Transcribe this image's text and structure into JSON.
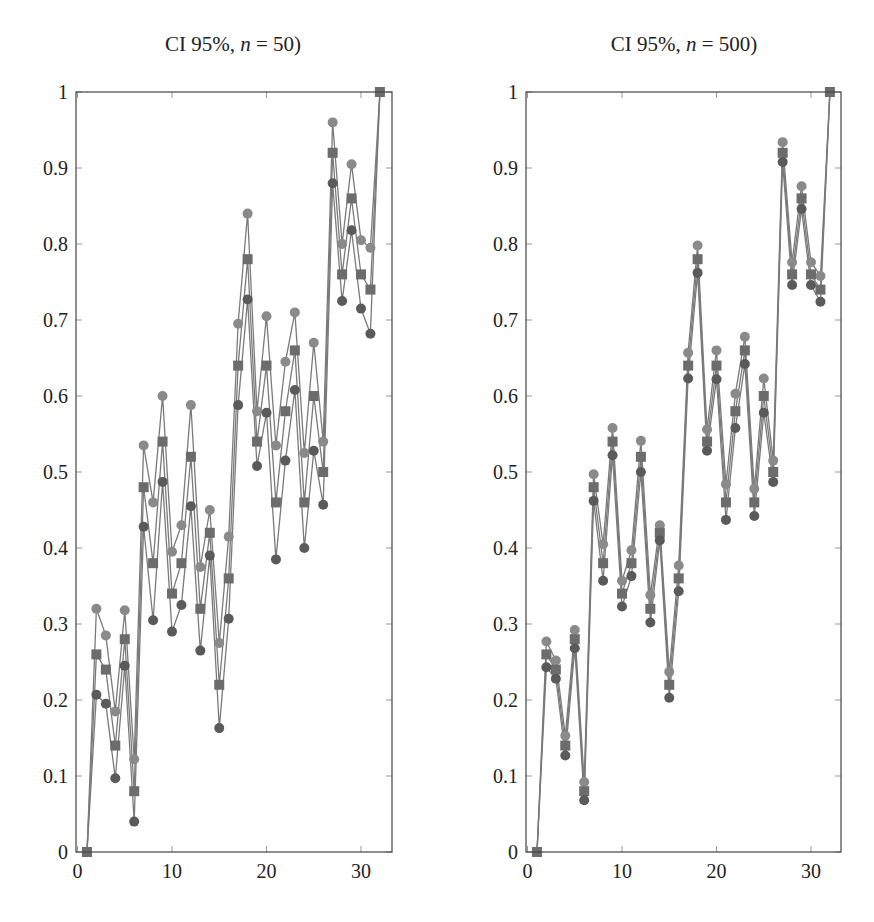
{
  "chart_data": [
    {
      "type": "line",
      "title_prefix": "CI 95%, ",
      "title_var": "n",
      "title_suffix": " = 50)",
      "xlabel": "",
      "ylabel": "",
      "xlim": [
        0,
        33.3
      ],
      "ylim": [
        0,
        1
      ],
      "xticks": [
        0,
        10,
        20,
        30
      ],
      "yticks": [
        0,
        0.1,
        0.2,
        0.3,
        0.4,
        0.5,
        0.6,
        0.7,
        0.8,
        0.9,
        1
      ],
      "grid": false,
      "x": [
        1,
        2,
        3,
        4,
        5,
        6,
        7,
        8,
        9,
        10,
        11,
        12,
        13,
        14,
        15,
        16,
        17,
        18,
        19,
        20,
        21,
        22,
        23,
        24,
        25,
        26,
        27,
        28,
        29,
        30,
        31,
        32
      ],
      "series": [
        {
          "name": "upper CI",
          "marker": "circle",
          "color": "#8a8a8a",
          "values": [
            0,
            0.32,
            0.285,
            0.185,
            0.318,
            0.122,
            0.535,
            0.46,
            0.6,
            0.395,
            0.43,
            0.588,
            0.375,
            0.45,
            0.275,
            0.415,
            0.695,
            0.84,
            0.58,
            0.705,
            0.535,
            0.645,
            0.71,
            0.525,
            0.67,
            0.54,
            0.96,
            0.8,
            0.905,
            0.805,
            0.795,
            1.0
          ]
        },
        {
          "name": "mean",
          "marker": "square",
          "color": "#6c6c6c",
          "values": [
            0,
            0.26,
            0.24,
            0.14,
            0.28,
            0.08,
            0.48,
            0.38,
            0.54,
            0.34,
            0.38,
            0.52,
            0.32,
            0.42,
            0.22,
            0.36,
            0.64,
            0.78,
            0.54,
            0.64,
            0.46,
            0.58,
            0.66,
            0.46,
            0.6,
            0.5,
            0.92,
            0.76,
            0.86,
            0.76,
            0.74,
            1.0
          ]
        },
        {
          "name": "lower CI",
          "marker": "circle",
          "color": "#5a5a5a",
          "values": [
            0,
            0.207,
            0.195,
            0.097,
            0.245,
            0.04,
            0.428,
            0.305,
            0.487,
            0.29,
            0.325,
            0.455,
            0.265,
            0.39,
            0.163,
            0.307,
            0.588,
            0.727,
            0.508,
            0.578,
            0.385,
            0.515,
            0.608,
            0.4,
            0.528,
            0.457,
            0.88,
            0.725,
            0.818,
            0.715,
            0.682,
            1.0
          ]
        }
      ]
    },
    {
      "type": "line",
      "title_prefix": "CI 95%, ",
      "title_var": "n",
      "title_suffix": " = 500)",
      "xlabel": "",
      "ylabel": "",
      "xlim": [
        0,
        33.3
      ],
      "ylim": [
        0,
        1
      ],
      "xticks": [
        0,
        10,
        20,
        30
      ],
      "yticks": [
        0,
        0.1,
        0.2,
        0.3,
        0.4,
        0.5,
        0.6,
        0.7,
        0.8,
        0.9,
        1
      ],
      "grid": false,
      "x": [
        1,
        2,
        3,
        4,
        5,
        6,
        7,
        8,
        9,
        10,
        11,
        12,
        13,
        14,
        15,
        16,
        17,
        18,
        19,
        20,
        21,
        22,
        23,
        24,
        25,
        26,
        27,
        28,
        29,
        30,
        31,
        32
      ],
      "series": [
        {
          "name": "upper CI",
          "marker": "circle",
          "color": "#8a8a8a",
          "values": [
            0,
            0.277,
            0.252,
            0.153,
            0.292,
            0.092,
            0.497,
            0.405,
            0.558,
            0.357,
            0.397,
            0.541,
            0.338,
            0.43,
            0.237,
            0.377,
            0.657,
            0.798,
            0.556,
            0.66,
            0.484,
            0.603,
            0.678,
            0.478,
            0.623,
            0.515,
            0.934,
            0.776,
            0.876,
            0.776,
            0.758,
            1.0
          ]
        },
        {
          "name": "mean",
          "marker": "square",
          "color": "#6c6c6c",
          "values": [
            0,
            0.26,
            0.24,
            0.14,
            0.28,
            0.08,
            0.48,
            0.38,
            0.54,
            0.34,
            0.38,
            0.52,
            0.32,
            0.42,
            0.22,
            0.36,
            0.64,
            0.78,
            0.54,
            0.64,
            0.46,
            0.58,
            0.66,
            0.46,
            0.6,
            0.5,
            0.92,
            0.76,
            0.86,
            0.76,
            0.74,
            1.0
          ]
        },
        {
          "name": "lower CI",
          "marker": "circle",
          "color": "#5a5a5a",
          "values": [
            0,
            0.243,
            0.228,
            0.127,
            0.268,
            0.068,
            0.462,
            0.357,
            0.522,
            0.323,
            0.363,
            0.5,
            0.302,
            0.41,
            0.203,
            0.343,
            0.623,
            0.762,
            0.528,
            0.622,
            0.437,
            0.558,
            0.642,
            0.442,
            0.578,
            0.487,
            0.908,
            0.746,
            0.846,
            0.746,
            0.724,
            1.0
          ]
        }
      ]
    }
  ],
  "style": {
    "line_color": "#7a7a7a",
    "axis_color": "#444444"
  }
}
